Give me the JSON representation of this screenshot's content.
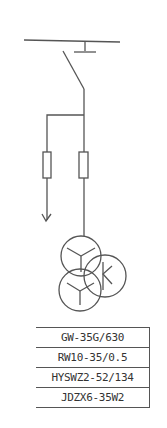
{
  "diagram": {
    "type": "single-line electrical schematic",
    "stroke_color": "#555555",
    "components": [
      {
        "name": "busbar",
        "symbol": "horizontal bus line"
      },
      {
        "name": "disconnect-switch",
        "symbol": "isolating switch blade"
      },
      {
        "name": "fuse-left",
        "symbol": "fuse rectangle"
      },
      {
        "name": "fuse-right",
        "symbol": "fuse rectangle"
      },
      {
        "name": "arrester-ground-arrow",
        "symbol": "down arrow"
      },
      {
        "name": "voltage-transformer",
        "symbol": "three overlapping circles (Y, Y, delta)"
      }
    ]
  },
  "spec_table": {
    "rows": [
      {
        "label": "GW-35G/630"
      },
      {
        "label": "RW10-35/0.5"
      },
      {
        "label": "HYSWZ2-52/134"
      },
      {
        "label": "JDZX6-35W2"
      }
    ]
  }
}
